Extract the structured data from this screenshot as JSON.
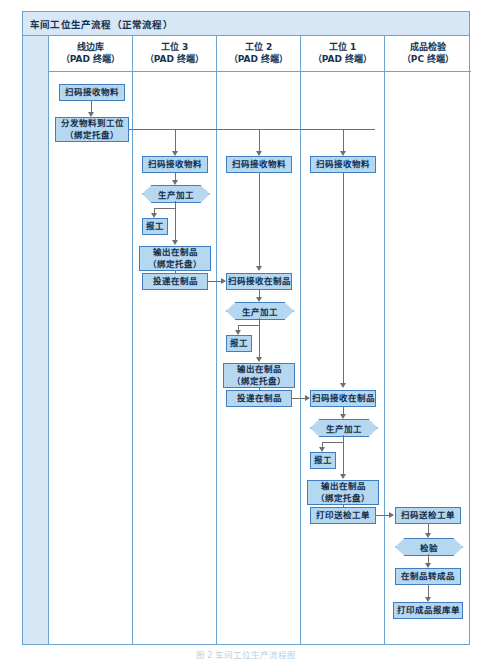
{
  "diagram": {
    "title": "车间工位生产流程（正常流程）",
    "caption": "图 2 车间工位生产流程图",
    "colors": {
      "node_fill": "#b6d7f0",
      "node_border": "#3f7fbf",
      "frame_border": "#6ba3d0",
      "header_fill": "#d7e7f5",
      "connector": "#6f6f6f"
    },
    "lanes": [
      {
        "name": "线边库",
        "terminal": "（PAD 终端）"
      },
      {
        "name": "工位 3",
        "terminal": "（PAD 终端）"
      },
      {
        "name": "工位 2",
        "terminal": "（PAD 终端）"
      },
      {
        "name": "工位 1",
        "terminal": "（PAD 终端）"
      },
      {
        "name": "成品检验",
        "terminal": "（PC 终端）"
      }
    ],
    "nodes": {
      "w0_n1": "扫码接收物料",
      "w0_n2_l1": "分发物料到工位",
      "w0_n2_l2": "（绑定托盘）",
      "w1_n1": "扫码接收物料",
      "w1_n2": "生产加工",
      "w1_n3": "报工",
      "w1_n4_l1": "输出在制品",
      "w1_n4_l2": "（绑定托盘）",
      "w1_n5": "投递在制品",
      "w2_n1": "扫码接收物料",
      "w2_n2": "扫码接收在制品",
      "w2_n3": "生产加工",
      "w2_n4": "报工",
      "w2_n5_l1": "输出在制品",
      "w2_n5_l2": "（绑定托盘）",
      "w2_n6": "投递在制品",
      "w3_n1": "扫码接收物料",
      "w3_n2": "扫码接收在制品",
      "w3_n3": "生产加工",
      "w3_n4": "报工",
      "w3_n5_l1": "输出在制品",
      "w3_n5_l2": "（绑定托盘）",
      "w3_n6": "打印送检工单",
      "w4_n1": "扫码送检工单",
      "w4_n2": "检验",
      "w4_n3": "在制品转成品",
      "w4_n4": "打印成品报库单"
    }
  }
}
